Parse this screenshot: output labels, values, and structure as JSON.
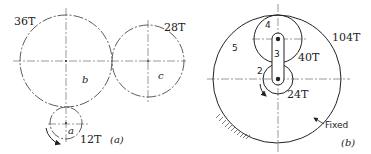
{
  "figure_a": {
    "caption": "(a)",
    "gears": [
      {
        "id": "b",
        "label": "b",
        "teeth_label": "36T"
      },
      {
        "id": "c",
        "label": "c",
        "teeth_label": "28T"
      },
      {
        "id": "a",
        "label": "a",
        "teeth_label": "12T"
      }
    ]
  },
  "figure_b": {
    "caption": "(b)",
    "parts": [
      {
        "id": "2",
        "label": "2",
        "teeth_label": "24T"
      },
      {
        "id": "3",
        "label": "3"
      },
      {
        "id": "4",
        "label": "4",
        "teeth_label": "40T"
      },
      {
        "id": "5",
        "label": "5",
        "teeth_label": "104T"
      }
    ],
    "fixed_label": "Fixed"
  }
}
